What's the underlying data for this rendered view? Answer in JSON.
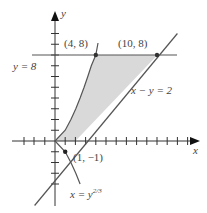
{
  "diagram": {
    "axes": {
      "x_label": "x",
      "y_label": "y"
    },
    "curves": [
      {
        "id": "parabola",
        "equation_lhs": "x = y",
        "exponent": "2/3"
      },
      {
        "id": "line",
        "equation": "x − y = 2"
      },
      {
        "id": "horizontal",
        "equation": "y = 8"
      }
    ],
    "points": [
      {
        "label": "(4, 8)",
        "x": 4,
        "y": 8
      },
      {
        "label": "(10, 8)",
        "x": 10,
        "y": 8
      },
      {
        "label": "(1, −1)",
        "x": 1,
        "y": -1
      }
    ],
    "shaded_region": "between x = y^(2/3) and x − y = 2, from y = 0 to y = 8",
    "colors": {
      "shade": "#d9d9d9",
      "curve": "#555555",
      "axis": "#333333"
    }
  }
}
